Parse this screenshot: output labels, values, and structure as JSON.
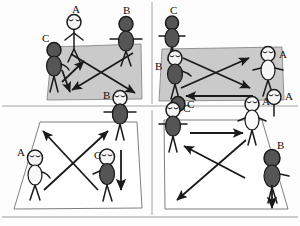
{
  "figure": {
    "type": "diagram",
    "caption": "",
    "panel_count": 4,
    "layout": "2x2 grid of sketch panels separated by thin rules",
    "style": "hand-drawn stick figures on quadrilateral floor planes with directional arrows"
  },
  "colors": {
    "background": "#fdfdfd",
    "ink": "#1a1a1a",
    "floor_gray": "#c9c9c9",
    "floor_white": "#ffffff",
    "figure_dark": "#4a4a4a",
    "figure_light": "#f2f2f2",
    "divider": "#8c8c8c"
  },
  "panels": [
    {
      "id": "panel-top-left",
      "floor_fill": "gray",
      "people": [
        {
          "label": "A",
          "shade": "light",
          "pose": "standing-arms-down"
        },
        {
          "label": "B",
          "shade": "dark",
          "pose": "standing-arms-out"
        },
        {
          "label": "C",
          "shade": "dark",
          "pose": "standing-arms-down"
        },
        {
          "label": "B",
          "shade": "dark",
          "pose": "standing-arms-out"
        }
      ],
      "arrows": [
        {
          "kind": "diagonal",
          "direction": "down-right"
        },
        {
          "kind": "diagonal",
          "direction": "down-left"
        },
        {
          "kind": "branch",
          "direction": "up-right"
        },
        {
          "kind": "branch",
          "direction": "down-left"
        }
      ],
      "labels": [
        "A",
        "B",
        "C",
        "B"
      ]
    },
    {
      "id": "panel-top-right",
      "floor_fill": "gray",
      "people": [
        {
          "label": "C",
          "shade": "dark",
          "pose": "standing-arms-down"
        },
        {
          "label": "B",
          "shade": "dark",
          "pose": "standing-arms-out"
        },
        {
          "label": "A",
          "shade": "light",
          "pose": "standing-arms-out"
        },
        {
          "label": "A",
          "shade": "light",
          "pose": "standing-arms-down"
        },
        {
          "label": "C",
          "shade": "dark",
          "pose": "standing-arms-down"
        }
      ],
      "arrows": [
        {
          "kind": "diagonal",
          "direction": "up-right"
        },
        {
          "kind": "diagonal",
          "direction": "down-right"
        },
        {
          "kind": "horizontal",
          "direction": "left"
        }
      ],
      "labels": [
        "C",
        "B",
        "A",
        "A",
        "C"
      ]
    },
    {
      "id": "panel-bottom-left",
      "floor_fill": "white",
      "people": [
        {
          "label": "A",
          "shade": "light",
          "pose": "standing-arms-down"
        },
        {
          "label": "C",
          "shade": "dark",
          "pose": "standing-arms-down"
        },
        {
          "label": "B",
          "shade": "dark",
          "pose": "standing-arms-out"
        }
      ],
      "arrows": [
        {
          "kind": "diagonal",
          "direction": "up-left"
        },
        {
          "kind": "diagonal",
          "direction": "up-right"
        },
        {
          "kind": "vertical",
          "direction": "down"
        }
      ],
      "labels": [
        "A",
        "C"
      ]
    },
    {
      "id": "panel-bottom-right",
      "floor_fill": "white",
      "people": [
        {
          "label": "C",
          "shade": "dark",
          "pose": "standing-arms-down"
        },
        {
          "label": "A",
          "shade": "light",
          "pose": "standing-arms-down"
        },
        {
          "label": "B",
          "shade": "dark",
          "pose": "standing-arms-out"
        }
      ],
      "arrows": [
        {
          "kind": "horizontal",
          "direction": "right"
        },
        {
          "kind": "diagonal",
          "direction": "up-left"
        },
        {
          "kind": "diagonal",
          "direction": "down-left"
        },
        {
          "kind": "vertical",
          "direction": "down"
        }
      ],
      "labels": [
        "C",
        "A",
        "B"
      ]
    }
  ],
  "text_labels": [
    {
      "id": "tl-a",
      "text": "A",
      "x": 72,
      "y": 6
    },
    {
      "id": "tl-b",
      "text": "B",
      "x": 122,
      "y": 6
    },
    {
      "id": "tl-c",
      "text": "C",
      "x": 44,
      "y": 36
    },
    {
      "id": "tl-b2",
      "text": "B",
      "x": 104,
      "y": 91
    },
    {
      "id": "tr-c",
      "text": "C",
      "x": 170,
      "y": 6
    },
    {
      "id": "tr-b",
      "text": "B",
      "x": 154,
      "y": 58
    },
    {
      "id": "tr-a",
      "text": "A",
      "x": 277,
      "y": 46
    },
    {
      "id": "tr-a2",
      "text": "A",
      "x": 285,
      "y": 88
    },
    {
      "id": "tr-c2",
      "text": "C",
      "x": 188,
      "y": 104
    },
    {
      "id": "bl-a",
      "text": "A",
      "x": 18,
      "y": 146
    },
    {
      "id": "bl-c",
      "text": "C",
      "x": 96,
      "y": 152
    },
    {
      "id": "br-c",
      "text": "C",
      "x": 180,
      "y": 105
    },
    {
      "id": "br-a",
      "text": "A",
      "x": 262,
      "y": 98
    },
    {
      "id": "br-b",
      "text": "B",
      "x": 274,
      "y": 140
    }
  ]
}
